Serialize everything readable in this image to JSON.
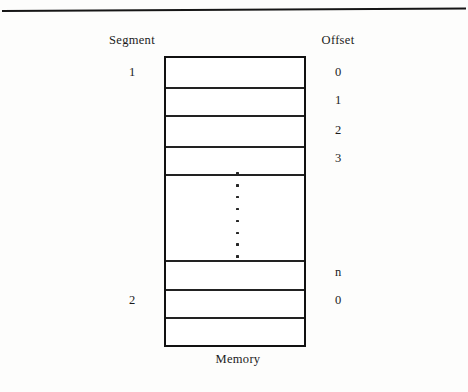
{
  "figure": {
    "caption": "Memory",
    "segment_heading": "Segment",
    "offset_heading": "Offset",
    "rule_color": "#161616",
    "box_border_color": "#111111",
    "divider_color": "#222222",
    "text_color": "#1b1b1b",
    "background_color": "#fdfdfc"
  },
  "segment_labels": [
    {
      "text": "1",
      "top": 65
    },
    {
      "text": "2",
      "top": 293
    }
  ],
  "offset_labels": [
    {
      "text": "0",
      "top": 65
    },
    {
      "text": "1",
      "top": 93
    },
    {
      "text": "2",
      "top": 123
    },
    {
      "text": "3",
      "top": 151
    },
    {
      "text": "n",
      "top": 265
    },
    {
      "text": "0",
      "top": 293
    }
  ],
  "memory_box": {
    "cell_count": 8,
    "dividers": [
      29,
      57,
      88,
      116,
      202,
      231,
      259
    ]
  },
  "ellipsis": {
    "dot_count": 8,
    "meaning": "vertical-ellipsis"
  }
}
